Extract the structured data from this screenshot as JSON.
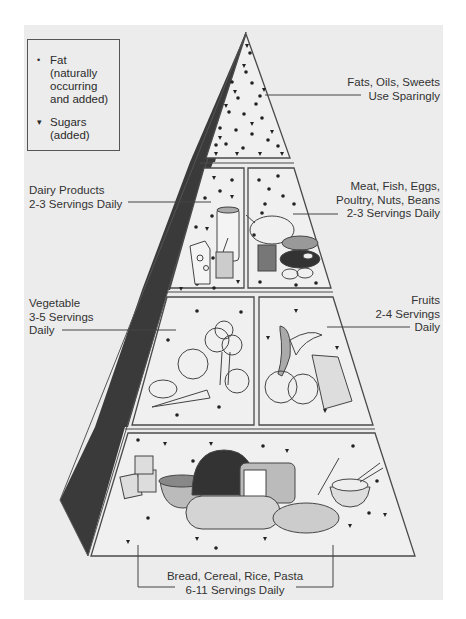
{
  "legend": {
    "items": [
      {
        "symbol": "•",
        "icon": "dot-icon",
        "label_lines": [
          "Fat",
          "(naturally",
          "occurring",
          "and added)"
        ]
      },
      {
        "symbol": "▾",
        "icon": "triangle-icon",
        "label_lines": [
          "Sugars",
          "(added)"
        ]
      }
    ]
  },
  "tiers": {
    "fats": {
      "line1": "Fats, Oils, Sweets",
      "line2": "Use Sparingly"
    },
    "dairy": {
      "line1": "Dairy Products",
      "line2": "2-3 Servings Daily"
    },
    "meat": {
      "line1": "Meat, Fish, Eggs,",
      "line2": "Poultry, Nuts, Beans",
      "line3": "2-3 Servings Daily"
    },
    "vegetable": {
      "line1": "Vegetable",
      "line2": "3-5 Servings",
      "line3": "Daily"
    },
    "fruits": {
      "line1": "Fruits",
      "line2": "2-4 Servings",
      "line3": "Daily"
    },
    "grains": {
      "line1": "Bread, Cereal, Rice, Pasta",
      "line2": "6-11 Servings Daily"
    }
  },
  "colors": {
    "paper": "#ececec",
    "side_face": "#3a3a3a",
    "outline": "#4a4a4a",
    "face": "#f0f0f0"
  }
}
